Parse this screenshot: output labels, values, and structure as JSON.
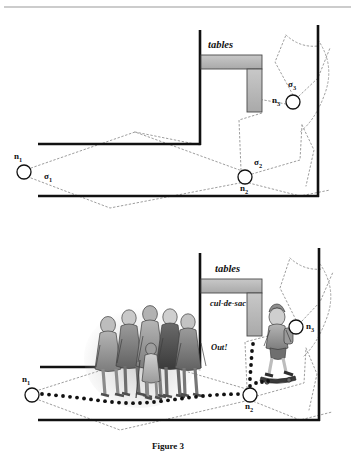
{
  "figure": {
    "caption": "Figure 3",
    "panels": [
      {
        "id": "top-panel",
        "labels": {
          "tables": "tables",
          "node1": "n1",
          "node2": "n2",
          "node3": "n3",
          "sigma1": "σ1",
          "sigma2": "σ2",
          "sigma3": "σ3"
        },
        "nodes": [
          {
            "name": "n1",
            "label": "n",
            "sub": "1",
            "cx": 24,
            "cy": 172,
            "r": 7
          },
          {
            "name": "n2",
            "label": "n",
            "sub": "2",
            "cx": 245,
            "cy": 177,
            "r": 7
          },
          {
            "name": "n3",
            "label": "n",
            "sub": "3",
            "cx": 293,
            "cy": 102,
            "r": 7
          }
        ],
        "sigmas": [
          {
            "name": "sigma1",
            "label": "σ",
            "sub": "1",
            "x": 45,
            "y": 177
          },
          {
            "name": "sigma2",
            "label": "σ",
            "sub": "2",
            "x": 255,
            "y": 163
          },
          {
            "name": "sigma3",
            "label": "σ",
            "sub": "3",
            "x": 289,
            "y": 86
          }
        ]
      },
      {
        "id": "bottom-panel",
        "labels": {
          "tables": "tables",
          "culdesac": "cul-de-sac",
          "out": "Out!",
          "node1": "n1",
          "node2": "n2",
          "node3": "n3"
        },
        "nodes": [
          {
            "name": "n1",
            "label": "n",
            "sub": "1",
            "cx": 32,
            "cy": 395,
            "r": 7
          },
          {
            "name": "n2",
            "label": "n",
            "sub": "2",
            "cx": 250,
            "cy": 395,
            "r": 7
          },
          {
            "name": "n3",
            "label": "n",
            "sub": "3",
            "cx": 296,
            "cy": 327,
            "r": 7
          }
        ],
        "illustrations": [
          {
            "name": "crowd-of-people",
            "alt": "group of adults standing in a crowd blocking the corridor"
          },
          {
            "name": "child-on-skateboard",
            "alt": "child riding a skateboard near node n3"
          }
        ]
      }
    ],
    "colors": {
      "wall": "#111111",
      "table_fill": "#b9b9b9",
      "table_stroke": "#4a4a4a",
      "dashed_path": "#9a9a9a",
      "trail_dots": "#111111",
      "rule": "#9a9a9a",
      "background": "#ffffff"
    }
  }
}
